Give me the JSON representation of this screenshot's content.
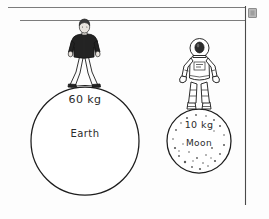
{
  "page": {
    "width": 269,
    "height": 219,
    "background_color": "#fdfdfd",
    "ink_color": "#1d1d1d",
    "rule_line_color": "#7c7c7c",
    "margin_line_color": "#4a4a4a",
    "marker_color": "#b9b9b9"
  },
  "diagram": {
    "earth": {
      "mass_label": "60 kg",
      "body_label": "Earth",
      "figure_name": "person-standing"
    },
    "moon": {
      "mass_label": "10 kg",
      "body_label": "Moon",
      "figure_name": "astronaut-standing"
    }
  }
}
